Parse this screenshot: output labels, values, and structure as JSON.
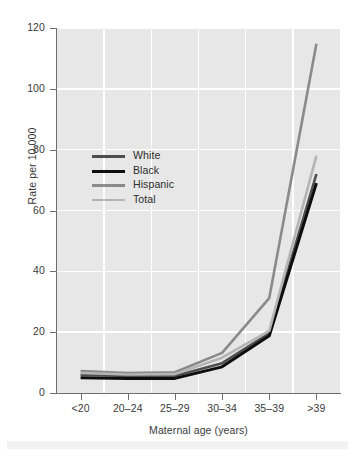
{
  "chart_data": {
    "type": "line",
    "title": "",
    "subtitle": "",
    "xlabel": "Maternal age (years)",
    "ylabel": "Rate per 10,000",
    "categories": [
      "<20",
      "20–24",
      "25–29",
      "30–34",
      "35–39",
      ">39"
    ],
    "ylim": [
      0,
      120
    ],
    "yticks": [
      0,
      20,
      40,
      60,
      80,
      100,
      120
    ],
    "ytick_labels": [
      "0",
      "20",
      "40",
      "60",
      "80",
      "100",
      "120"
    ],
    "grid": true,
    "legend_position": "upper-left-inside",
    "series": [
      {
        "name": "White",
        "color": "#4d4d4d",
        "width": 2.6,
        "values": [
          6.0,
          5.6,
          5.6,
          9.8,
          19.6,
          72.0
        ]
      },
      {
        "name": "Black",
        "color": "#0d0d0d",
        "width": 3.0,
        "values": [
          5.0,
          4.8,
          4.8,
          8.6,
          18.8,
          69.0
        ]
      },
      {
        "name": "Hispanic",
        "color": "#8a8a8a",
        "width": 2.6,
        "values": [
          7.2,
          6.6,
          6.8,
          13.2,
          31.2,
          114.8
        ]
      },
      {
        "name": "Total",
        "color": "#b4b4b4",
        "width": 2.6,
        "values": [
          6.6,
          6.1,
          6.2,
          11.6,
          20.4,
          78.0
        ]
      }
    ]
  },
  "style": {
    "plot_background": "#e7e7e7",
    "gridline_color": "#ffffff",
    "axis_color": "#6f6f6f",
    "text_color": "#3a3a3a",
    "page_background": "#ffffff"
  }
}
